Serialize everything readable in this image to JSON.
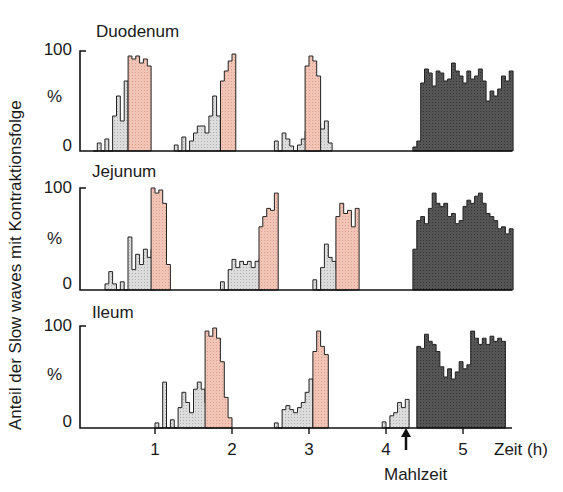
{
  "chart_data": {
    "type": "bar",
    "subtype": "stacked-panel histogram (step plot)",
    "title": "",
    "ylabel": "Anteil der Slow waves mit Kontraktionsfolge",
    "xlabel": "Zeit (h)",
    "ylim": [
      0,
      100
    ],
    "yticks": [
      "0",
      "%",
      "100"
    ],
    "xticks": [
      "1",
      "2",
      "3",
      "4",
      "5"
    ],
    "xlim": [
      0,
      5.65
    ],
    "bin_width_h": 0.05,
    "annotation": {
      "label": "Mahlzeit",
      "x": 4.2,
      "symbol": "arrow-up"
    },
    "legend_phases": {
      "phase2": {
        "meaning": "irregular activity (pre-MMC)",
        "color": "#dcdcdc"
      },
      "phase3": {
        "meaning": "regular activity front (MMC)",
        "color": "#f2c4b6"
      },
      "fed": {
        "meaning": "postprandial pattern",
        "color": "#555555"
      }
    },
    "panels": [
      {
        "name": "Duodenum",
        "series": [
          {
            "phase": "phase2",
            "start_h": 0.2,
            "values": [
              0,
              8,
              0,
              12,
              0,
              35,
              55,
              30,
              70
            ]
          },
          {
            "phase": "phase3",
            "start_h": 0.65,
            "values": [
              95,
              92,
              95,
              88,
              92,
              85
            ]
          },
          {
            "phase": "phase2",
            "start_h": 1.25,
            "values": [
              6,
              0,
              14,
              0,
              10,
              18,
              25,
              25,
              18,
              35,
              55,
              35
            ]
          },
          {
            "phase": "phase3",
            "start_h": 1.85,
            "values": [
              70,
              80,
              90,
              97
            ]
          },
          {
            "phase": "phase2",
            "start_h": 2.55,
            "values": [
              10,
              0,
              18,
              12,
              5,
              0,
              6,
              12,
              20,
              15,
              22,
              28,
              22,
              30,
              8
            ]
          },
          {
            "phase": "phase3",
            "start_h": 2.95,
            "values": [
              85,
              95,
              90,
              75
            ]
          },
          {
            "phase": "fed",
            "start_h": 4.35,
            "values": [
              4,
              10,
              68,
              82,
              78,
              65,
              80,
              78,
              70,
              72,
              88,
              80,
              75,
              68,
              80,
              72,
              75,
              82,
              70,
              50,
              60,
              55,
              62,
              75,
              70,
              80
            ]
          }
        ]
      },
      {
        "name": "Jejunum",
        "series": [
          {
            "phase": "phase2",
            "start_h": 0.35,
            "values": [
              6,
              18,
              6,
              0,
              8,
              0,
              52,
              20,
              35,
              25,
              40,
              32,
              40
            ]
          },
          {
            "phase": "phase3",
            "start_h": 0.95,
            "values": [
              100,
              95,
              98,
              85,
              25
            ]
          },
          {
            "phase": "phase2",
            "start_h": 1.85,
            "values": [
              8,
              0,
              20,
              30,
              22,
              28,
              25,
              28,
              22,
              28,
              30
            ]
          },
          {
            "phase": "phase3",
            "start_h": 2.35,
            "values": [
              62,
              72,
              80,
              78,
              95
            ]
          },
          {
            "phase": "phase2",
            "start_h": 3.05,
            "values": [
              10,
              0,
              22,
              45,
              32,
              28,
              20,
              15,
              22
            ]
          },
          {
            "phase": "phase3",
            "start_h": 3.35,
            "values": [
              72,
              85,
              75,
              78,
              62,
              80
            ]
          },
          {
            "phase": "fed",
            "start_h": 4.35,
            "values": [
              40,
              68,
              72,
              65,
              80,
              95,
              85,
              82,
              85,
              72,
              75,
              65,
              68,
              82,
              88,
              85,
              92,
              95,
              85,
              75,
              72,
              68,
              60,
              62,
              55,
              60
            ]
          }
        ]
      },
      {
        "name": "Ileum",
        "series": [
          {
            "phase": "phase2",
            "start_h": 1.0,
            "values": [
              5,
              0,
              45,
              0,
              8,
              0,
              20,
              35,
              25,
              15,
              38,
              45,
              38,
              25,
              55
            ]
          },
          {
            "phase": "phase3",
            "start_h": 1.65,
            "values": [
              95,
              90,
              98,
              88,
              65,
              30,
              10
            ]
          },
          {
            "phase": "phase2",
            "start_h": 2.55,
            "values": [
              5,
              0,
              18,
              22,
              18,
              15,
              20,
              25,
              35,
              48
            ]
          },
          {
            "phase": "phase3",
            "start_h": 3.05,
            "values": [
              75,
              95,
              80,
              72
            ]
          },
          {
            "phase": "phase2",
            "start_h": 3.95,
            "values": [
              6,
              0,
              12,
              15,
              25,
              20,
              28
            ]
          },
          {
            "phase": "fed",
            "start_h": 4.4,
            "values": [
              80,
              78,
              92,
              85,
              82,
              75,
              60,
              50,
              58,
              48,
              55,
              65,
              58,
              62,
              95,
              88,
              82,
              88,
              82,
              90,
              85,
              88,
              85
            ]
          }
        ]
      }
    ]
  },
  "labels": {
    "ylabel": "Anteil der Slow waves mit Kontraktionsfolge",
    "y100": "100",
    "ypct": "%",
    "y0": "0",
    "x1": "1",
    "x2": "2",
    "x3": "3",
    "x4": "4",
    "x5": "5",
    "xunit": "Zeit (h)",
    "meal": "Mahlzeit",
    "p0": "Duodenum",
    "p1": "Jejunum",
    "p2": "Ileum"
  },
  "colors": {
    "phase2": "#dcdcdc",
    "phase3": "#f2c4b6",
    "fed": "#555555",
    "stroke": "#222222"
  }
}
